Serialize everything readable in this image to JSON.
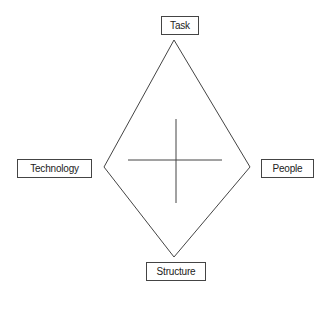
{
  "diagram": {
    "type": "diamond",
    "nodes": {
      "top": {
        "label": "Task"
      },
      "left": {
        "label": "Technology"
      },
      "right": {
        "label": "People"
      },
      "bottom": {
        "label": "Structure"
      }
    },
    "colors": {
      "line": "#444444",
      "background": "#ffffff"
    }
  }
}
